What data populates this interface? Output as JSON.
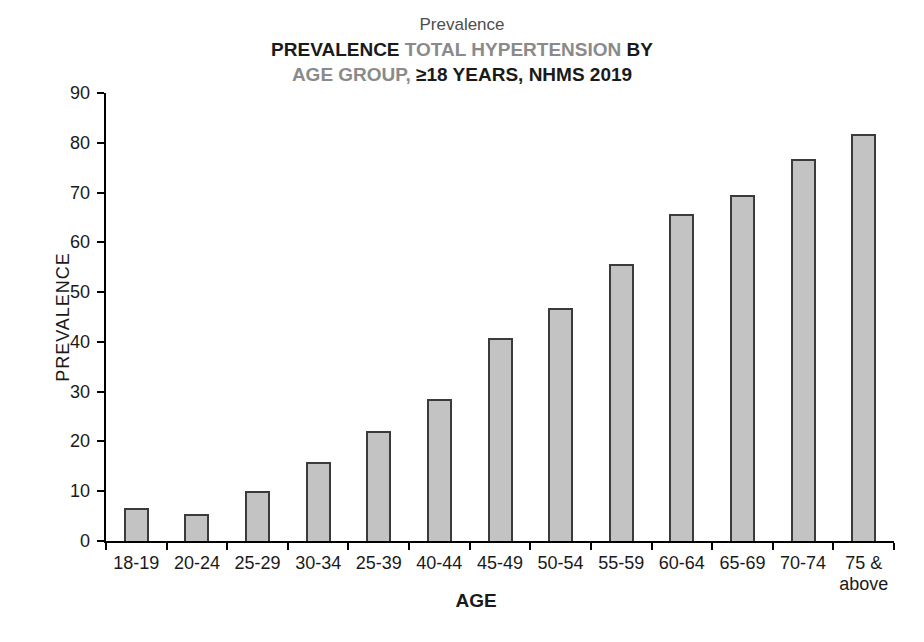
{
  "title": {
    "overtitle": "Prevalence",
    "line2_segments": [
      {
        "text": "PREVALENCE ",
        "tone": "dark"
      },
      {
        "text": "TOTAL HYPERTENSION ",
        "tone": "gray"
      },
      {
        "text": "BY",
        "tone": "dark"
      }
    ],
    "line3_segments": [
      {
        "text": "AGE GROUP, ",
        "tone": "gray"
      },
      {
        "text": "≥18 YEARS, NHMS 2019",
        "tone": "dark"
      }
    ]
  },
  "chart_data": {
    "type": "bar",
    "categories": [
      "18-19",
      "20-24",
      "25-29",
      "30-34",
      "25-39",
      "40-44",
      "45-49",
      "50-54",
      "55-59",
      "60-64",
      "65-69",
      "70-74",
      "75 &\nabove"
    ],
    "values": [
      6.6,
      5.5,
      10.0,
      15.9,
      22.2,
      28.6,
      40.7,
      46.8,
      55.6,
      65.7,
      69.6,
      76.7,
      81.7
    ],
    "xlabel": "AGE",
    "ylabel": "PREVALENCE",
    "ylim": [
      0,
      90
    ],
    "ytick_step": 10,
    "yticks": [
      0,
      10,
      20,
      30,
      40,
      50,
      60,
      70,
      80,
      90
    ],
    "grid": false,
    "legend": "none"
  },
  "colors": {
    "bar_fill": "#c3c3c3",
    "bar_border": "#3b3b3b",
    "axis": "#000000",
    "text_dark": "#1a1a1a",
    "text_gray": "#8a8a8a"
  }
}
